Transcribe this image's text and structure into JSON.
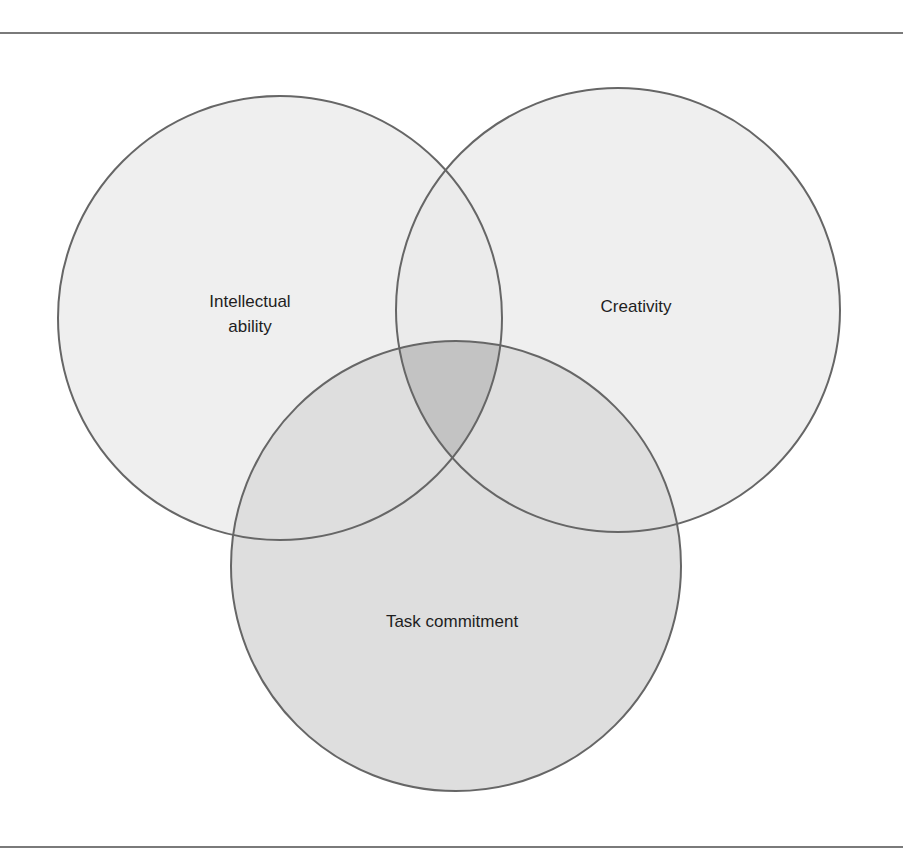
{
  "diagram": {
    "type": "venn",
    "sets": [
      {
        "id": "intellectual-ability",
        "label_lines": [
          "Intellectual",
          "ability"
        ],
        "label": "Intellectual ability",
        "cx": 280,
        "cy": 318,
        "r": 222,
        "fill": "#eeeeee"
      },
      {
        "id": "creativity",
        "label_lines": [
          "Creativity"
        ],
        "label": "Creativity",
        "cx": 618,
        "cy": 310,
        "r": 222,
        "fill": "#eeeeee"
      },
      {
        "id": "task-commitment",
        "label_lines": [
          "Task commitment"
        ],
        "label": "Task commitment",
        "cx": 456,
        "cy": 566,
        "r": 225,
        "fill": "#dddddd"
      }
    ],
    "intersection_fill": "#c3c3c3",
    "stroke_color": "#666666",
    "rule_color": "#7a7a7a"
  }
}
